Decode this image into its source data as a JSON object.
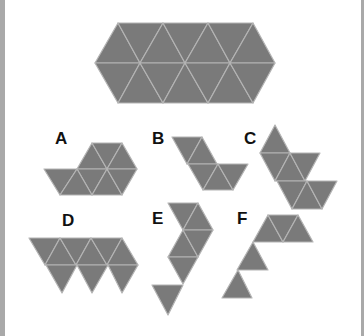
{
  "colors": {
    "fill": "#7a7a7a",
    "edge": "#b4b4b4",
    "background": "#ffffff",
    "frame": "#a9a9a9",
    "label": "#111111"
  },
  "target_shape": {
    "name": "target",
    "triangles": [
      [
        [
          95,
          63
        ],
        [
          140,
          63
        ],
        [
          118,
          23
        ]
      ],
      [
        [
          118,
          23
        ],
        [
          163,
          23
        ],
        [
          140,
          63
        ]
      ],
      [
        [
          140,
          63
        ],
        [
          185,
          63
        ],
        [
          163,
          23
        ]
      ],
      [
        [
          163,
          23
        ],
        [
          208,
          23
        ],
        [
          185,
          63
        ]
      ],
      [
        [
          185,
          63
        ],
        [
          230,
          63
        ],
        [
          208,
          23
        ]
      ],
      [
        [
          208,
          23
        ],
        [
          253,
          23
        ],
        [
          230,
          63
        ]
      ],
      [
        [
          230,
          63
        ],
        [
          275,
          63
        ],
        [
          253,
          23
        ]
      ],
      [
        [
          95,
          63
        ],
        [
          140,
          63
        ],
        [
          118,
          103
        ]
      ],
      [
        [
          118,
          103
        ],
        [
          163,
          103
        ],
        [
          140,
          63
        ]
      ],
      [
        [
          140,
          63
        ],
        [
          185,
          63
        ],
        [
          163,
          103
        ]
      ],
      [
        [
          163,
          103
        ],
        [
          208,
          103
        ],
        [
          185,
          63
        ]
      ],
      [
        [
          185,
          63
        ],
        [
          230,
          63
        ],
        [
          208,
          103
        ]
      ],
      [
        [
          208,
          103
        ],
        [
          253,
          103
        ],
        [
          230,
          63
        ]
      ],
      [
        [
          230,
          63
        ],
        [
          275,
          63
        ],
        [
          253,
          103
        ]
      ]
    ]
  },
  "options": [
    {
      "label": "A",
      "label_pos": [
        55,
        130
      ],
      "triangles": [
        [
          [
            77,
            169
          ],
          [
            107,
            169
          ],
          [
            92,
            143
          ]
        ],
        [
          [
            92,
            143
          ],
          [
            122,
            143
          ],
          [
            107,
            169
          ]
        ],
        [
          [
            107,
            169
          ],
          [
            137,
            169
          ],
          [
            122,
            143
          ]
        ],
        [
          [
            77,
            169
          ],
          [
            107,
            169
          ],
          [
            92,
            195
          ]
        ],
        [
          [
            92,
            195
          ],
          [
            122,
            195
          ],
          [
            107,
            169
          ]
        ],
        [
          [
            107,
            169
          ],
          [
            137,
            169
          ],
          [
            122,
            195
          ]
        ],
        [
          [
            44,
            169
          ],
          [
            77,
            169
          ],
          [
            60,
            195
          ]
        ],
        [
          [
            60,
            195
          ],
          [
            92,
            195
          ],
          [
            77,
            169
          ]
        ]
      ]
    },
    {
      "label": "B",
      "label_pos": [
        152,
        130
      ],
      "triangles": [
        [
          [
            172,
            137
          ],
          [
            202,
            137
          ],
          [
            187,
            164
          ]
        ],
        [
          [
            187,
            164
          ],
          [
            217,
            164
          ],
          [
            202,
            137
          ]
        ],
        [
          [
            188,
            164
          ],
          [
            218,
            164
          ],
          [
            203,
            190
          ]
        ],
        [
          [
            203,
            190
          ],
          [
            233,
            190
          ],
          [
            218,
            164
          ]
        ],
        [
          [
            218,
            164
          ],
          [
            248,
            164
          ],
          [
            233,
            190
          ]
        ]
      ]
    },
    {
      "label": "C",
      "label_pos": [
        244,
        130
      ],
      "triangles": [
        [
          [
            260,
            153
          ],
          [
            290,
            153
          ],
          [
            275,
            125
          ]
        ],
        [
          [
            260,
            153
          ],
          [
            290,
            153
          ],
          [
            275,
            181
          ]
        ],
        [
          [
            275,
            181
          ],
          [
            305,
            181
          ],
          [
            290,
            153
          ]
        ],
        [
          [
            290,
            153
          ],
          [
            320,
            153
          ],
          [
            305,
            181
          ]
        ],
        [
          [
            277,
            181
          ],
          [
            307,
            181
          ],
          [
            292,
            209
          ]
        ],
        [
          [
            292,
            209
          ],
          [
            322,
            209
          ],
          [
            307,
            181
          ]
        ],
        [
          [
            307,
            181
          ],
          [
            337,
            181
          ],
          [
            322,
            209
          ]
        ]
      ]
    },
    {
      "label": "D",
      "label_pos": [
        62,
        212
      ],
      "triangles": [
        [
          [
            29,
            238
          ],
          [
            60,
            238
          ],
          [
            45,
            265
          ]
        ],
        [
          [
            45,
            265
          ],
          [
            76,
            265
          ],
          [
            60,
            238
          ]
        ],
        [
          [
            60,
            238
          ],
          [
            91,
            238
          ],
          [
            76,
            265
          ]
        ],
        [
          [
            76,
            265
          ],
          [
            107,
            265
          ],
          [
            91,
            238
          ]
        ],
        [
          [
            91,
            238
          ],
          [
            122,
            238
          ],
          [
            107,
            265
          ]
        ],
        [
          [
            107,
            265
          ],
          [
            138,
            265
          ],
          [
            122,
            238
          ]
        ],
        [
          [
            46,
            265
          ],
          [
            77,
            265
          ],
          [
            62,
            293
          ]
        ],
        [
          [
            77,
            265
          ],
          [
            108,
            265
          ],
          [
            92,
            293
          ]
        ],
        [
          [
            108,
            265
          ],
          [
            138,
            265
          ],
          [
            122,
            293
          ]
        ]
      ]
    },
    {
      "label": "E",
      "label_pos": [
        152,
        210
      ],
      "triangles": [
        [
          [
            168,
            203
          ],
          [
            198,
            203
          ],
          [
            183,
            230
          ]
        ],
        [
          [
            183,
            230
          ],
          [
            213,
            230
          ],
          [
            198,
            203
          ]
        ],
        [
          [
            168,
            257
          ],
          [
            198,
            257
          ],
          [
            183,
            230
          ]
        ],
        [
          [
            183,
            230
          ],
          [
            213,
            230
          ],
          [
            198,
            257
          ]
        ],
        [
          [
            168,
            257
          ],
          [
            198,
            257
          ],
          [
            183,
            284
          ]
        ],
        [
          [
            152,
            285
          ],
          [
            183,
            285
          ],
          [
            168,
            315
          ]
        ]
      ]
    },
    {
      "label": "F",
      "label_pos": [
        237,
        210
      ],
      "triangles": [
        [
          [
            253,
            242
          ],
          [
            283,
            242
          ],
          [
            268,
            215
          ]
        ],
        [
          [
            268,
            215
          ],
          [
            298,
            215
          ],
          [
            283,
            242
          ]
        ],
        [
          [
            283,
            242
          ],
          [
            313,
            242
          ],
          [
            298,
            215
          ]
        ],
        [
          [
            237,
            270
          ],
          [
            268,
            270
          ],
          [
            253,
            242
          ]
        ],
        [
          [
            222,
            298
          ],
          [
            252,
            298
          ],
          [
            238,
            270
          ]
        ]
      ]
    }
  ]
}
